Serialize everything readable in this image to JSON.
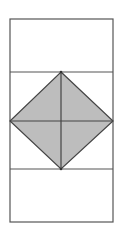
{
  "diagram": {
    "type": "geometric-figure",
    "colors": {
      "stroke": "#555555",
      "fill": "#bdbdbd",
      "background": "#ffffff"
    },
    "outer_rect": {
      "x": 10,
      "y": 19,
      "width": 103,
      "height": 203
    },
    "dividers_y": [
      72,
      169
    ],
    "diamond": {
      "top": [
        61,
        72
      ],
      "right": [
        113,
        121
      ],
      "bottom": [
        61,
        169
      ],
      "left": [
        10,
        121
      ]
    }
  }
}
